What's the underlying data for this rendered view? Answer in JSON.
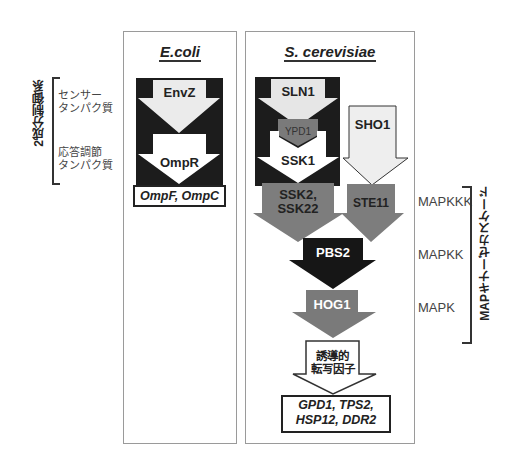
{
  "left_annotation": {
    "group_label": "2成分制御系",
    "sensor_label": "センサー\nタンパク質",
    "sensor_line1": "センサー",
    "sensor_line2": "タンパク質",
    "regulator_line1": "応答調節",
    "regulator_line2": "タンパク質"
  },
  "ecoli": {
    "title": "E.coli",
    "arrows": [
      "EnvZ",
      "OmpR"
    ],
    "target_genes": "OmpF, OmpC"
  },
  "yeast": {
    "title": "S. cerevisiae",
    "arrows": {
      "sln1": "SLN1",
      "ypd1": "YPD1",
      "ssk1": "SSK1",
      "sho1": "SHO1",
      "ssk2": "SSK2,",
      "ssk22": "SSK22",
      "ste11": "STE11",
      "pbs2": "PBS2",
      "hog1": "HOG1",
      "tf_line1": "誘導的",
      "tf_line2": "転写因子"
    },
    "target_line1": "GPD1, TPS2,",
    "target_line2": "HSP12, DDR2"
  },
  "right_annotation": {
    "levels": [
      "MAPKKK",
      "MAPKK",
      "MAPK"
    ],
    "group_label": "MAPキナーゼカスケード"
  },
  "colors": {
    "black_box": "#1c1c1c",
    "light_arrow": "#e8e8e8",
    "gray_arrow": "#7a7a7a",
    "dark_arrow": "#1a1a1a",
    "white_arrow": "#ffffff",
    "panel_border": "#9a9a9a"
  }
}
